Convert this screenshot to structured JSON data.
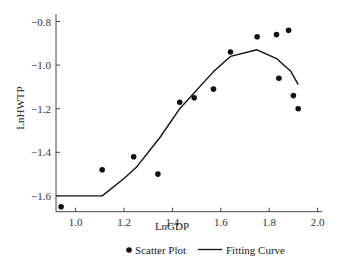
{
  "chart_data": {
    "type": "scatter",
    "title": "",
    "xlabel": "LnGDP",
    "ylabel": "LnHWTP",
    "xlim": [
      0.92,
      2.02
    ],
    "ylim": [
      -1.68,
      -0.78
    ],
    "x_ticks": [
      1.0,
      1.2,
      1.4,
      1.6,
      1.8,
      2.0
    ],
    "x_tick_labels": [
      "1.0",
      "1.2",
      "1.4",
      "1.6",
      "1.8",
      "2.0"
    ],
    "y_ticks": [
      -0.8,
      -1.0,
      -1.2,
      -1.4,
      -1.6
    ],
    "y_tick_labels": [
      "-0.8",
      "-1.0",
      "-1.2",
      "-1.4",
      "-1.6"
    ],
    "grid": false,
    "legend_position": "bottom",
    "series": [
      {
        "name": "Scatter Plot",
        "kind": "scatter",
        "marker": "filled-circle",
        "color": "#111111",
        "x": [
          0.94,
          1.11,
          1.24,
          1.34,
          1.43,
          1.49,
          1.57,
          1.64,
          1.75,
          1.83,
          1.88,
          1.84,
          1.9,
          1.92
        ],
        "y": [
          -1.65,
          -1.48,
          -1.42,
          -1.5,
          -1.17,
          -1.15,
          -1.11,
          -0.94,
          -0.87,
          -0.86,
          -0.84,
          -1.06,
          -1.14,
          -1.2
        ]
      },
      {
        "name": "Fitting Curve",
        "kind": "line",
        "color": "#111111",
        "x": [
          0.92,
          1.11,
          1.2,
          1.25,
          1.35,
          1.43,
          1.57,
          1.64,
          1.75,
          1.83,
          1.89,
          1.92
        ],
        "y": [
          -1.6,
          -1.6,
          -1.52,
          -1.47,
          -1.33,
          -1.2,
          -1.03,
          -0.96,
          -0.93,
          -0.97,
          -1.03,
          -1.09
        ]
      }
    ]
  },
  "legend": {
    "items": [
      {
        "label": "Scatter Plot",
        "symbol": "dot"
      },
      {
        "label": "Fitting Curve",
        "symbol": "line"
      }
    ]
  }
}
